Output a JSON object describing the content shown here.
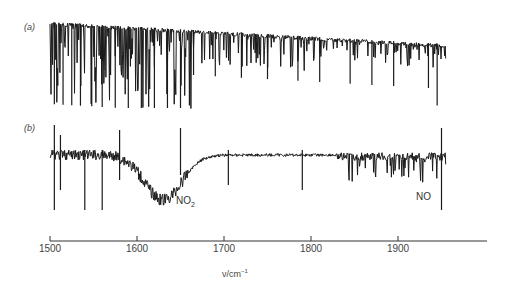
{
  "chart_data": {
    "type": "line",
    "title": "",
    "xlabel": "ν/cm⁻¹",
    "ylabel": "",
    "xlim": [
      1500,
      1960
    ],
    "xticks": [
      1500,
      1600,
      1700,
      1800,
      1900
    ],
    "grid": false,
    "legend": null,
    "panels": [
      {
        "label": "(a)",
        "description": "Dense absorption line spectrum; deep lines 1500–1660 cm⁻¹, baseline rising toward the right with smaller lines up to ~1955 cm⁻¹",
        "x_range": [
          1500,
          1955
        ],
        "features": [
          {
            "x": 1505,
            "depth": "deep"
          },
          {
            "x": 1515,
            "depth": "deep"
          },
          {
            "x": 1525,
            "depth": "deep"
          },
          {
            "x": 1535,
            "depth": "deep"
          },
          {
            "x": 1548,
            "depth": "deep"
          },
          {
            "x": 1560,
            "depth": "deep"
          },
          {
            "x": 1575,
            "depth": "deep"
          },
          {
            "x": 1590,
            "depth": "deep"
          },
          {
            "x": 1605,
            "depth": "deep"
          },
          {
            "x": 1620,
            "depth": "deep"
          },
          {
            "x": 1635,
            "depth": "deep"
          },
          {
            "x": 1650,
            "depth": "deep"
          },
          {
            "x": 1665,
            "depth": "medium"
          },
          {
            "x": 1690,
            "depth": "medium"
          },
          {
            "x": 1720,
            "depth": "medium"
          },
          {
            "x": 1750,
            "depth": "medium"
          },
          {
            "x": 1785,
            "depth": "medium"
          },
          {
            "x": 1810,
            "depth": "medium"
          },
          {
            "x": 1845,
            "depth": "medium"
          },
          {
            "x": 1870,
            "depth": "medium"
          },
          {
            "x": 1895,
            "depth": "medium"
          },
          {
            "x": 1935,
            "depth": "medium"
          },
          {
            "x": 1945,
            "depth": "deep"
          }
        ]
      },
      {
        "label": "(b)",
        "description": "Difference spectrum with a broad NO₂ band centred near 1630 cm⁻¹ and an NO line series at 1840–1950 cm⁻¹",
        "x_range": [
          1500,
          1955
        ],
        "annotations": [
          {
            "text": "NO₂",
            "x": 1640,
            "position": "below band minimum"
          },
          {
            "text": "NO",
            "x": 1920,
            "position": "below right end"
          }
        ],
        "features": [
          {
            "x": 1630,
            "type": "broad band minimum",
            "species": "NO₂"
          },
          {
            "x": 1840,
            "to": 1950,
            "type": "rotational line series",
            "species": "NO"
          },
          {
            "x": 1950,
            "type": "sharp vertical spike"
          }
        ]
      }
    ]
  },
  "labels": {
    "panel_a": "(a)",
    "panel_b": "(b)",
    "no2_main": "NO",
    "no2_sub": "2",
    "no": "NO",
    "xlabel_main": "ν/cm",
    "xlabel_sup": "−1"
  },
  "axis": {
    "ticks": [
      {
        "value": "1500",
        "x": 50
      },
      {
        "value": "1600",
        "x": 137
      },
      {
        "value": "1700",
        "x": 224
      },
      {
        "value": "1800",
        "x": 311
      },
      {
        "value": "1900",
        "x": 398
      }
    ]
  },
  "colors": {
    "trace": "#1a1a1a",
    "axis": "#333333",
    "text": "#444444"
  }
}
